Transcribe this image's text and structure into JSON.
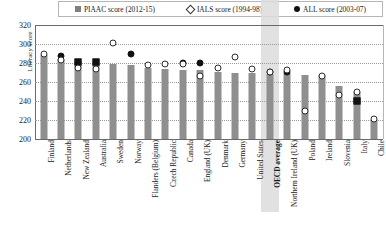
{
  "legend": {
    "items": [
      {
        "label": "PIAAC score (2012-15)",
        "marker": "square",
        "color": "#808080",
        "name": "legend-piaac"
      },
      {
        "label": "IALS score (1994-98)",
        "marker": "diamond-open",
        "color": "#ffffff",
        "name": "legend-ials"
      },
      {
        "label": "ALL score (2003-07)",
        "marker": "dot-filled",
        "color": "#111111",
        "name": "legend-all"
      }
    ]
  },
  "axis": {
    "ylabel": "Literacy score",
    "yticks": [
      320,
      300,
      280,
      260,
      240,
      220,
      200
    ]
  },
  "chart_data": {
    "type": "bar",
    "title": "",
    "xlabel": "",
    "ylabel": "Literacy score",
    "ylim": [
      200,
      320
    ],
    "ytick_step": 20,
    "grid": true,
    "legend_position": "top",
    "highlight_category": "OECD average",
    "categories": [
      "Finland",
      "Netherlands",
      "New Zealand",
      "Australia",
      "Sweden",
      "Norway",
      "Flanders (Belgium)",
      "Czech Republic",
      "Canada",
      "England (UK)",
      "Denmark",
      "Germany",
      "United States",
      "OECD average",
      "Northern Ireland (UK)",
      "Poland",
      "Ireland",
      "Slovenia",
      "Italy",
      "Chile"
    ],
    "series": [
      {
        "name": "PIAAC score (2012-15)",
        "type": "bar",
        "values": [
          288,
          284,
          281,
          280,
          279,
          278,
          275,
          274,
          273,
          273,
          271,
          270,
          270,
          268,
          269,
          267,
          267,
          256,
          250,
          220
        ]
      },
      {
        "name": "IALS score (1994-98)",
        "type": "marker-open",
        "values": [
          289,
          283,
          275,
          274,
          301,
          null,
          278,
          279,
          279,
          266,
          275,
          286,
          274,
          271,
          273,
          230,
          266,
          246,
          250,
          221
        ]
      },
      {
        "name": "ALL score (2003-07)",
        "type": "marker-filled",
        "values": [
          null,
          287,
          281,
          281,
          null,
          290,
          null,
          null,
          280,
          280,
          null,
          null,
          null,
          271,
          271,
          null,
          null,
          null,
          240,
          null
        ]
      }
    ]
  }
}
